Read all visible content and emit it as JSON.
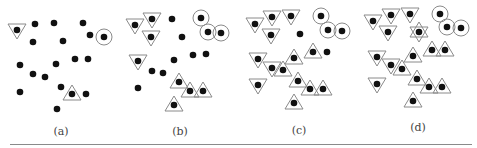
{
  "figure": {
    "colors": {
      "dot": "#111111",
      "outline": "#8a8a8a",
      "rule": "#8a8a8a",
      "label": "#444444"
    },
    "panels": [
      {
        "label": "(a)",
        "label_x": 61,
        "label_y": 125,
        "points": [
          {
            "x": 17,
            "y": 30,
            "mark": "tri-down"
          },
          {
            "x": 35,
            "y": 24,
            "mark": "none"
          },
          {
            "x": 54,
            "y": 23,
            "mark": "none"
          },
          {
            "x": 83,
            "y": 23,
            "mark": "none"
          },
          {
            "x": 90,
            "y": 35,
            "mark": "none"
          },
          {
            "x": 104,
            "y": 37,
            "mark": "circle"
          },
          {
            "x": 33,
            "y": 42,
            "mark": "none"
          },
          {
            "x": 63,
            "y": 41,
            "mark": "none"
          },
          {
            "x": 20,
            "y": 65,
            "mark": "none"
          },
          {
            "x": 56,
            "y": 64,
            "mark": "none"
          },
          {
            "x": 75,
            "y": 59,
            "mark": "none"
          },
          {
            "x": 88,
            "y": 59,
            "mark": "none"
          },
          {
            "x": 33,
            "y": 74,
            "mark": "none"
          },
          {
            "x": 45,
            "y": 77,
            "mark": "none"
          },
          {
            "x": 61,
            "y": 87,
            "mark": "none"
          },
          {
            "x": 20,
            "y": 92,
            "mark": "none"
          },
          {
            "x": 72,
            "y": 94,
            "mark": "tri-up"
          },
          {
            "x": 86,
            "y": 94,
            "mark": "none"
          },
          {
            "x": 57,
            "y": 109,
            "mark": "none"
          }
        ]
      },
      {
        "label": "(b)",
        "label_x": 180,
        "label_y": 125,
        "points": [
          {
            "x": 135,
            "y": 25,
            "mark": "tri-down"
          },
          {
            "x": 152,
            "y": 19,
            "mark": "tri-down"
          },
          {
            "x": 151,
            "y": 37,
            "mark": "tri-down"
          },
          {
            "x": 172,
            "y": 19,
            "mark": "none"
          },
          {
            "x": 201,
            "y": 18,
            "mark": "circle"
          },
          {
            "x": 208,
            "y": 32,
            "mark": "circle"
          },
          {
            "x": 221,
            "y": 33,
            "mark": "circle"
          },
          {
            "x": 182,
            "y": 37,
            "mark": "none"
          },
          {
            "x": 138,
            "y": 61,
            "mark": "tri-down"
          },
          {
            "x": 174,
            "y": 60,
            "mark": "none"
          },
          {
            "x": 193,
            "y": 55,
            "mark": "none"
          },
          {
            "x": 206,
            "y": 54,
            "mark": "none"
          },
          {
            "x": 152,
            "y": 71,
            "mark": "none"
          },
          {
            "x": 163,
            "y": 73,
            "mark": "none"
          },
          {
            "x": 138,
            "y": 88,
            "mark": "none"
          },
          {
            "x": 179,
            "y": 82,
            "mark": "tri-up"
          },
          {
            "x": 190,
            "y": 91,
            "mark": "tri-up"
          },
          {
            "x": 203,
            "y": 91,
            "mark": "tri-up"
          },
          {
            "x": 174,
            "y": 105,
            "mark": "tri-up"
          }
        ]
      },
      {
        "label": "(c)",
        "label_x": 299,
        "label_y": 124,
        "points": [
          {
            "x": 255,
            "y": 24,
            "mark": "tri-down"
          },
          {
            "x": 272,
            "y": 17,
            "mark": "tri-down"
          },
          {
            "x": 291,
            "y": 16,
            "mark": "tri-down"
          },
          {
            "x": 271,
            "y": 35,
            "mark": "tri-down"
          },
          {
            "x": 300,
            "y": 34,
            "mark": "none"
          },
          {
            "x": 321,
            "y": 16,
            "mark": "circle"
          },
          {
            "x": 328,
            "y": 30,
            "mark": "circle"
          },
          {
            "x": 342,
            "y": 31,
            "mark": "circle"
          },
          {
            "x": 294,
            "y": 58,
            "mark": "tri-up"
          },
          {
            "x": 313,
            "y": 52,
            "mark": "tri-up"
          },
          {
            "x": 327,
            "y": 52,
            "mark": "none"
          },
          {
            "x": 258,
            "y": 59,
            "mark": "tri-down"
          },
          {
            "x": 272,
            "y": 68,
            "mark": "tri-down"
          },
          {
            "x": 283,
            "y": 70,
            "mark": "tri-up"
          },
          {
            "x": 258,
            "y": 85,
            "mark": "tri-down"
          },
          {
            "x": 298,
            "y": 81,
            "mark": "tri-up"
          },
          {
            "x": 310,
            "y": 89,
            "mark": "tri-up"
          },
          {
            "x": 323,
            "y": 89,
            "mark": "tri-up"
          },
          {
            "x": 294,
            "y": 103,
            "mark": "tri-up"
          }
        ]
      },
      {
        "label": "(d)",
        "label_x": 418,
        "label_y": 121,
        "points": [
          {
            "x": 373,
            "y": 21,
            "mark": "tri-down"
          },
          {
            "x": 391,
            "y": 15,
            "mark": "tri-down"
          },
          {
            "x": 410,
            "y": 14,
            "mark": "tri-down"
          },
          {
            "x": 388,
            "y": 32,
            "mark": "tri-down"
          },
          {
            "x": 419,
            "y": 32,
            "mark": "star"
          },
          {
            "x": 440,
            "y": 14,
            "mark": "circle"
          },
          {
            "x": 447,
            "y": 27,
            "mark": "circle"
          },
          {
            "x": 461,
            "y": 28,
            "mark": "circle"
          },
          {
            "x": 413,
            "y": 56,
            "mark": "tri-up"
          },
          {
            "x": 432,
            "y": 50,
            "mark": "tri-up"
          },
          {
            "x": 445,
            "y": 50,
            "mark": "tri-up"
          },
          {
            "x": 377,
            "y": 57,
            "mark": "tri-down"
          },
          {
            "x": 391,
            "y": 65,
            "mark": "tri-down"
          },
          {
            "x": 402,
            "y": 69,
            "mark": "tri-up"
          },
          {
            "x": 377,
            "y": 84,
            "mark": "tri-down"
          },
          {
            "x": 417,
            "y": 79,
            "mark": "tri-up"
          },
          {
            "x": 429,
            "y": 87,
            "mark": "tri-up"
          },
          {
            "x": 442,
            "y": 87,
            "mark": "tri-up"
          },
          {
            "x": 413,
            "y": 101,
            "mark": "tri-up"
          }
        ]
      }
    ]
  }
}
